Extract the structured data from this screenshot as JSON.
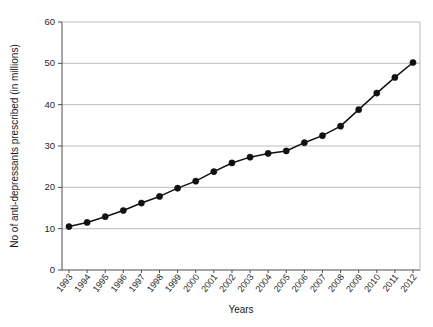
{
  "chart_data": {
    "type": "line",
    "title": "",
    "xlabel": "Years",
    "ylabel": "No of anti-depressants prescribed (in millions)",
    "categories": [
      "1993",
      "1994",
      "1995",
      "1996",
      "1997",
      "1998",
      "1999",
      "2000",
      "2001",
      "2002",
      "2003",
      "2004",
      "2005",
      "2006",
      "2007",
      "2008",
      "2009",
      "2010",
      "2011",
      "2012"
    ],
    "values": [
      10.5,
      11.5,
      12.9,
      14.4,
      16.2,
      17.8,
      19.8,
      21.5,
      23.8,
      25.9,
      27.3,
      28.2,
      28.8,
      30.8,
      32.5,
      34.8,
      38.8,
      42.8,
      46.6,
      50.2
    ],
    "series": [
      {
        "name": "Anti-depressants prescribed",
        "values": [
          10.5,
          11.5,
          12.9,
          14.4,
          16.2,
          17.8,
          19.8,
          21.5,
          23.8,
          25.9,
          27.3,
          28.2,
          28.8,
          30.8,
          32.5,
          34.8,
          38.8,
          42.8,
          46.6,
          50.2
        ]
      }
    ],
    "ylim": [
      0,
      60
    ],
    "yticks": [
      0,
      10,
      20,
      30,
      40,
      50,
      60
    ],
    "ytick_labels": [
      "0",
      "10",
      "20",
      "30",
      "40",
      "50",
      "60"
    ],
    "grid": true,
    "grid_axis": "y",
    "legend": false,
    "marker": "circle",
    "line_color": "#111111",
    "marker_color": "#111111",
    "grid_color": "#b3b3b3",
    "axis_color": "#4d4d4d",
    "background": "#ffffff"
  },
  "axes": {
    "x_title": "Years",
    "y_title": "No of anti-depressants prescribed (in millions)"
  }
}
